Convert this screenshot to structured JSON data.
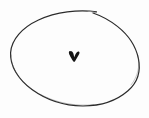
{
  "scene": {
    "title": "hand-drawn ellipse enclosing a small v mark",
    "description": "A thin hand-drawn oval outline on an off-white background with a small bold v-shaped tick near its center.",
    "medium": "pen-on-paper line drawing",
    "width": 149,
    "height": 118
  },
  "colors": {
    "background": "#fdfdfd",
    "ink": "#2b2b2b",
    "ink_light": "#555555",
    "mark": "#151515"
  },
  "shapes": {
    "ellipse": {
      "name": "hand-drawn-ellipse",
      "center_x": 75,
      "center_y": 58.5,
      "radius_x": 64,
      "radius_y": 48,
      "rotation_deg": -4,
      "stroke_width": 1.2,
      "stroke_color": "#2b2b2b",
      "fill": "none",
      "has_stroke_gap": true,
      "gap_start_x": 88,
      "gap_end_x": 97
    },
    "v_mark": {
      "name": "v-tick-mark",
      "center_x": 74,
      "center_y": 56,
      "width": 10,
      "height": 9,
      "fill": "#151515"
    }
  },
  "labels": {
    "figure_caption": "",
    "alt_text": "Oval outline with a small v mark inside"
  }
}
